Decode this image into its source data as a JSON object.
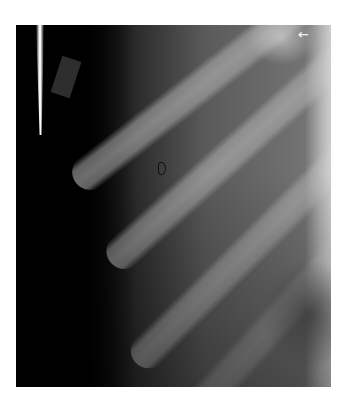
{
  "image": {
    "description": "Radiograph of lateral chest wall showing oblique ribs",
    "annotations": {
      "white_arrow": "←",
      "open_arrow_marker": "open-arrow"
    },
    "colors": {
      "background": "#ffffff",
      "dark": "#000000",
      "bone": "#b9b9b9",
      "arrow_white": "#ffffff",
      "arrow_outline": "#111111"
    }
  }
}
